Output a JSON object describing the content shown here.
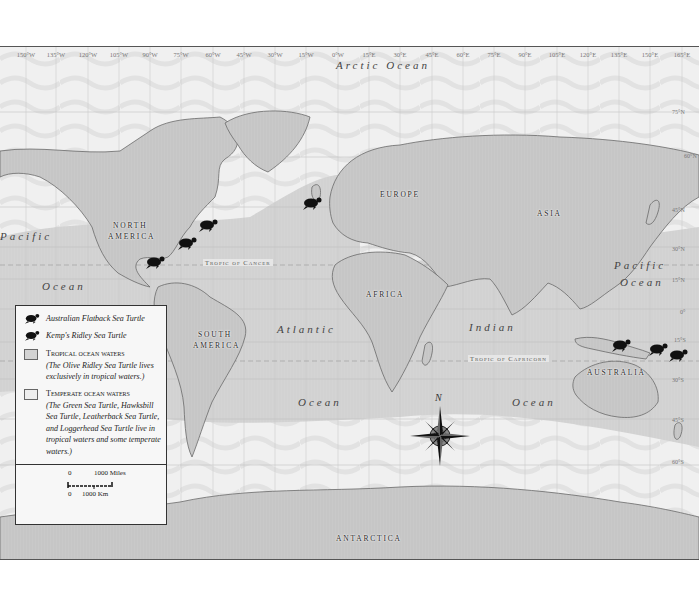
{
  "map": {
    "longitude_labels": [
      "150°W",
      "135°W",
      "120°W",
      "105°W",
      "90°W",
      "75°W",
      "60°W",
      "45°W",
      "30°W",
      "15°W",
      "0°W",
      "15°E",
      "30°E",
      "45°E",
      "60°E",
      "75°E",
      "90°E",
      "105°E",
      "120°E",
      "135°E",
      "150°E",
      "165°E"
    ],
    "latitude_labels": [
      "75°N",
      "60°N",
      "45°N",
      "30°N",
      "15°N",
      "0°",
      "15°S",
      "30°S",
      "45°S",
      "60°S"
    ],
    "continents": {
      "north_america_line1": "NORTH",
      "north_america_line2": "AMERICA",
      "south_america_line1": "SOUTH",
      "south_america_line2": "AMERICA",
      "europe": "EUROPE",
      "asia": "ASIA",
      "africa": "AFRICA",
      "australia": "AUSTRALIA",
      "antarctica": "ANTARCTICA"
    },
    "oceans": {
      "arctic": "Arctic Ocean",
      "pacific_west_1": "Pacific",
      "pacific_west_2": "Ocean",
      "pacific_east_1": "Pacific",
      "pacific_east_2": "Ocean",
      "atlantic_1": "Atlantic",
      "atlantic_2": "Ocean",
      "indian_1": "Indian",
      "indian_2": "Ocean"
    },
    "lines": {
      "tropic_of_cancer": "Tropic of Cancer",
      "tropic_of_capricorn": "Tropic of Capricorn"
    },
    "compass_label": "N",
    "colors": {
      "land": "#c8c8c8",
      "tropical_water": "#d3d3d3",
      "temperate_water": "#eeeeee",
      "coast_halo": "#f8f8f8",
      "turtle": "#111111",
      "frame": "#555555"
    }
  },
  "legend": {
    "items": [
      {
        "icon": "australian-flatback-turtle-icon",
        "label": "Australian Flatback Sea Turtle"
      },
      {
        "icon": "kemps-ridley-turtle-icon",
        "label": "Kemp's Ridley Sea Turtle"
      },
      {
        "swatch": "#d3d3d3",
        "title": "Tropical ocean waters",
        "note": "(The Olive Ridley Sea Turtle lives exclusively in tropical waters.)"
      },
      {
        "swatch": "#eeeeee",
        "title": "Temperate ocean waters",
        "note": "(The Green Sea Turtle, Hawksbill Sea Turtle, Leatherback Sea Turtle, and Loggerhead Sea Turtle live in tropical waters and some temperate waters.)"
      }
    ],
    "scale": {
      "miles_zero": "0",
      "miles_label": "1000 Miles",
      "km_zero": "0",
      "km_label": "1000 Km"
    }
  }
}
